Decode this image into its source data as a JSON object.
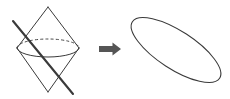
{
  "figure": {
    "title": "Conic section: plane cutting a double cone yields an ellipse",
    "background_color": "#ffffff",
    "ink_color": "#3a3a3a",
    "arrow_color": "#555555",
    "width": 230,
    "height": 99
  },
  "left_panel": {
    "name": "double-cone-with-cutting-plane",
    "description": "Double cone (two cones joined at their common base circle) drawn in outline, with a thick straight cutting line passing diagonally through it",
    "apex_top": {
      "x": 48,
      "y": 7
    },
    "apex_bottom": {
      "x": 48,
      "y": 92
    },
    "base_circle": {
      "label": "base-ellipse",
      "center_x": 48,
      "center_y": 48,
      "radius_x": 31,
      "radius_y": 9,
      "front_half_style": "solid",
      "back_half_style": "dashed"
    },
    "cone_edges": [
      {
        "from": {
          "x": 48,
          "y": 7
        },
        "to": {
          "x": 17,
          "y": 48
        }
      },
      {
        "from": {
          "x": 48,
          "y": 7
        },
        "to": {
          "x": 79,
          "y": 48
        }
      },
      {
        "from": {
          "x": 17,
          "y": 48
        },
        "to": {
          "x": 48,
          "y": 92
        }
      },
      {
        "from": {
          "x": 79,
          "y": 48
        },
        "to": {
          "x": 48,
          "y": 92
        }
      }
    ],
    "cutting_line": {
      "label": "cutting-plane-trace",
      "from": {
        "x": 13,
        "y": 21
      },
      "to": {
        "x": 73,
        "y": 94
      },
      "stroke_width": 2.1
    }
  },
  "arrow": {
    "name": "implies-arrow",
    "glyph": "→",
    "x": 99,
    "y": 49,
    "length": 22,
    "color": "#555555"
  },
  "right_panel": {
    "name": "resulting-ellipse",
    "description": "The ellipse obtained as the cross-section, drawn tilted down to the right",
    "center": {
      "x": 176,
      "y": 50
    },
    "radius_x": 52,
    "radius_y": 19,
    "rotation_deg": 33,
    "stroke_width": 1.05
  },
  "labels": {
    "left": "",
    "right": "",
    "caption": ""
  }
}
